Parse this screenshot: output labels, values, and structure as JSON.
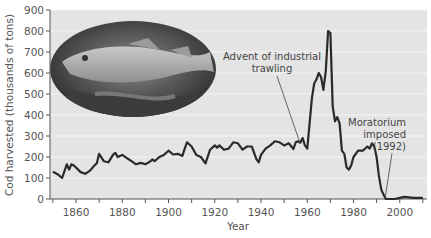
{
  "chart_data": {
    "type": "line",
    "title": "",
    "xlabel": "Year",
    "ylabel": "Cod harvested (thousands of tons)",
    "xlim": [
      1849,
      2011
    ],
    "ylim": [
      0,
      900
    ],
    "xticks": [
      1860,
      1880,
      1900,
      1920,
      1940,
      1960,
      1980,
      2000
    ],
    "yticks": [
      0,
      100,
      200,
      300,
      400,
      500,
      600,
      700,
      800,
      900
    ],
    "grid": true,
    "legend": null,
    "series": [
      {
        "name": "Cod harvest",
        "x": [
          1850,
          1852,
          1854,
          1856,
          1857,
          1858,
          1859,
          1860,
          1862,
          1864,
          1866,
          1868,
          1869,
          1870,
          1872,
          1874,
          1876,
          1877,
          1878,
          1879,
          1880,
          1882,
          1884,
          1886,
          1888,
          1890,
          1892,
          1893,
          1894,
          1896,
          1898,
          1899,
          1900,
          1902,
          1904,
          1906,
          1907,
          1908,
          1910,
          1912,
          1914,
          1916,
          1918,
          1920,
          1921,
          1922,
          1924,
          1926,
          1928,
          1930,
          1932,
          1934,
          1936,
          1938,
          1939,
          1940,
          1942,
          1944,
          1946,
          1948,
          1950,
          1952,
          1954,
          1955,
          1956,
          1957,
          1958,
          1959,
          1960,
          1962,
          1963,
          1964,
          1965,
          1966,
          1967,
          1968,
          1969,
          1970,
          1971,
          1972,
          1973,
          1974,
          1975,
          1976,
          1977,
          1978,
          1979,
          1980,
          1982,
          1984,
          1986,
          1987,
          1988,
          1989,
          1990,
          1991,
          1992,
          1993,
          1994,
          1996,
          1998,
          2000,
          2002,
          2004,
          2006,
          2008,
          2010
        ],
        "values": [
          130,
          118,
          100,
          165,
          140,
          165,
          160,
          150,
          128,
          120,
          135,
          160,
          170,
          215,
          180,
          175,
          210,
          220,
          200,
          205,
          210,
          195,
          180,
          165,
          172,
          165,
          178,
          188,
          180,
          200,
          210,
          220,
          230,
          212,
          215,
          205,
          240,
          270,
          250,
          210,
          200,
          170,
          235,
          255,
          245,
          255,
          235,
          240,
          270,
          265,
          235,
          250,
          250,
          190,
          175,
          210,
          240,
          255,
          275,
          270,
          255,
          265,
          238,
          270,
          275,
          268,
          290,
          255,
          240,
          480,
          550,
          570,
          600,
          580,
          520,
          610,
          800,
          790,
          440,
          370,
          390,
          360,
          230,
          215,
          150,
          140,
          160,
          200,
          230,
          230,
          250,
          240,
          265,
          250,
          200,
          110,
          45,
          20,
          0,
          0,
          0,
          5,
          10,
          8,
          5,
          5,
          5
        ]
      }
    ],
    "annotations": [
      {
        "text": [
          "Advent of industrial",
          "trawling"
        ],
        "points_to_year": 1958,
        "points_to_value": 240
      },
      {
        "text": [
          "Moratorium",
          "imposed",
          "(1992)"
        ],
        "points_to_year": 1992,
        "points_to_value": 0
      }
    ],
    "inset_image": "photograph of an Atlantic cod fish in an oval frame",
    "colors": {
      "line": "#2a2a2a",
      "plot_bg": "#e4e4e4",
      "grid": "#f4f4f4"
    }
  }
}
